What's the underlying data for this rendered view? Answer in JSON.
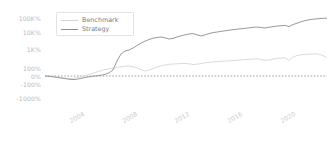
{
  "chart_data": {
    "type": "line",
    "title": "",
    "xlabel": "",
    "ylabel": "",
    "yscale": "symlog-percent",
    "grid": false,
    "legend_position": "upper-left",
    "zero_line": {
      "value": "0%",
      "style": "dashed",
      "color": "#8c8c8c"
    },
    "yticks": [
      {
        "label": "100K%",
        "value": 100000,
        "py": 18
      },
      {
        "label": "10K%",
        "value": 10000,
        "py": 32
      },
      {
        "label": "1K%",
        "value": 1000,
        "py": 49
      },
      {
        "label": "100%",
        "value": 100,
        "py": 68
      },
      {
        "label": "0%",
        "value": 0,
        "py": 76
      },
      {
        "label": "-100%",
        "value": -100,
        "py": 84
      },
      {
        "label": "-1000%",
        "value": -1000,
        "py": 98
      }
    ],
    "xticks": [
      {
        "label": "2004",
        "px": 68
      },
      {
        "label": "2008",
        "px": 121
      },
      {
        "label": "2012",
        "px": 173
      },
      {
        "label": "2016",
        "px": 226
      },
      {
        "label": "2020",
        "px": 279
      }
    ],
    "xlim": [
      "2001",
      "2022"
    ],
    "ylim": [
      -1000,
      200000
    ],
    "series": [
      {
        "name": "Benchmark",
        "color": "#d2d2d2",
        "width": 0.8,
        "points": "0,70 4,70.2 8,70.5 12,71 16,71.6 20,72.2 24,72.6 28,72.3 32,71.6 36,70.8 40,69.9 44,68.6 48,67.2 52,65.9 56,64.7 60,63.6 64,62.8 68,62.2 72,61.4 76,60.8 80,60.2 84,60.0 88,60.6 92,61.8 96,63.6 100,65.0 104,64.2 108,62.6 112,61.0 116,59.8 120,58.9 124,58.3 128,58.0 132,57.8 136,57.6 140,57.4 144,57.9 148,58.6 152,58.2 156,57.5 160,56.8 164,56.3 168,56.0 172,55.7 176,55.4 180,55.1 184,54.9 188,54.6 192,54.3 196,54.0 200,53.7 204,53.4 208,53.0 212,52.8 216,53.4 220,54.2 224,54.0 228,53.2 232,52.5 236,52.0 240,51.6 244,54.5 248,51.0 252,49.6 256,48.8 260,48.4 264,48.2 268,48.0 272,47.8 276,48.8 280,50.6 282,51.5"
      },
      {
        "name": "Strategy",
        "color": "#8e8e8e",
        "width": 0.9,
        "points": "0,70 4,70.3 8,70.8 12,71.4 16,72.0 20,72.6 24,73.2 28,73.6 32,73.2 36,72.4 40,71.6 44,70.8 48,70.2 52,69.8 56,69.2 60,68.4 64,66.8 68,64.0 72,55.0 76,48.0 80,45.0 84,44.0 88,42.0 92,39.5 96,37.0 100,35.2 104,33.5 108,32.2 112,31.5 116,31.0 120,31.8 124,33.0 128,32.4 132,31.0 136,29.8 140,28.8 144,28.0 148,27.6 152,28.8 156,30.0 160,28.8 164,27.6 168,26.6 172,26.0 176,25.4 180,24.8 184,24.2 188,23.7 192,23.2 196,22.8 200,22.3 204,21.9 208,21.4 212,21.0 216,21.5 220,22.0 224,21.3 228,20.6 232,20.1 236,19.7 240,19.4 244,20.6 248,18.6 252,17.2 256,15.8 260,14.6 264,13.8 268,13.2 272,12.8 276,12.4 280,12.2 282,12.3"
      }
    ]
  },
  "legend": {
    "items": [
      {
        "label": "Benchmark",
        "color": "#d2d2d2"
      },
      {
        "label": "Strategy",
        "color": "#8e8e8e"
      }
    ]
  }
}
